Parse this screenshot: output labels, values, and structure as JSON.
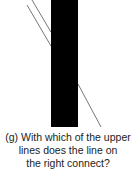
{
  "figure": {
    "type": "poggendorff-illusion",
    "bar_color": "#000000",
    "line_color": "#777777",
    "bar": {
      "x": 51,
      "y": 0,
      "width": 27,
      "height": 127
    },
    "upper_lines": [
      {
        "x1": 32,
        "y1": 0,
        "x2": 51,
        "y2": 32
      },
      {
        "x1": 27,
        "y1": 5,
        "x2": 51,
        "y2": 46
      }
    ],
    "right_line": {
      "x1": 78,
      "y1": 84,
      "x2": 101,
      "y2": 127
    }
  },
  "caption": {
    "line1": "(g) With which of the upper",
    "line2": "lines does the line on",
    "line3": "the right connect?"
  }
}
